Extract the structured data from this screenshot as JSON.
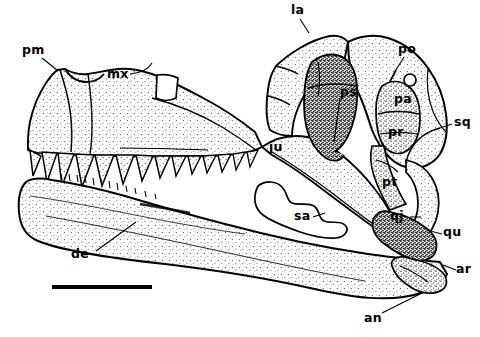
{
  "figure": {
    "view": "left lateral",
    "background_color": "#ffffff",
    "ink_color": "#000000"
  },
  "labels": [
    {
      "id": "pm",
      "text": "pm",
      "name": "premaxilla",
      "x": 22,
      "y": 44,
      "leader": [
        [
          42,
          58
        ],
        [
          57,
          70
        ]
      ]
    },
    {
      "id": "mx",
      "text": "mx",
      "name": "maxilla",
      "x": 107,
      "y": 68,
      "leader": [
        [
          130,
          74
        ],
        [
          143,
          72
        ],
        [
          152,
          63
        ]
      ]
    },
    {
      "id": "la",
      "text": "la",
      "name": "lacrimal",
      "x": 291,
      "y": 4,
      "leader": [
        [
          300,
          19
        ],
        [
          309,
          33
        ]
      ]
    },
    {
      "id": "po",
      "text": "po",
      "name": "postorbital",
      "x": 398,
      "y": 43,
      "leader": [
        [
          404,
          57
        ],
        [
          396,
          70
        ]
      ]
    },
    {
      "id": "ps",
      "text": "ps",
      "name": "parietal-squamosal region",
      "x": 340,
      "y": 86,
      "leader": []
    },
    {
      "id": "pa",
      "text": "pa",
      "name": "parietal",
      "x": 394,
      "y": 93,
      "leader": []
    },
    {
      "id": "pr",
      "text": "pr",
      "name": "prootic",
      "x": 388,
      "y": 126,
      "leader": []
    },
    {
      "id": "sq",
      "text": "sq",
      "name": "squamosal",
      "x": 454,
      "y": 116,
      "leader": [
        [
          452,
          124
        ],
        [
          440,
          128
        ]
      ]
    },
    {
      "id": "ju",
      "text": "ju",
      "name": "jugal",
      "x": 269,
      "y": 141,
      "leader": []
    },
    {
      "id": "pt",
      "text": "pt",
      "name": "pterygoid",
      "x": 382,
      "y": 176,
      "leader": []
    },
    {
      "id": "qj",
      "text": "qj",
      "name": "quadratojugal",
      "x": 390,
      "y": 210,
      "leader": [
        [
          410,
          217
        ],
        [
          421,
          217
        ]
      ]
    },
    {
      "id": "qu",
      "text": "qu",
      "name": "quadrate",
      "x": 443,
      "y": 226,
      "leader": [
        [
          442,
          234
        ],
        [
          430,
          231
        ]
      ]
    },
    {
      "id": "sa",
      "text": "sa",
      "name": "surangular",
      "x": 294,
      "y": 210,
      "leader": [
        [
          313,
          217
        ],
        [
          325,
          213
        ]
      ]
    },
    {
      "id": "ar",
      "text": "ar",
      "name": "articular",
      "x": 456,
      "y": 263,
      "leader": [
        [
          456,
          270
        ],
        [
          443,
          265
        ]
      ]
    },
    {
      "id": "an",
      "text": "an",
      "name": "angular",
      "x": 364,
      "y": 312,
      "leader": [
        [
          382,
          313
        ],
        [
          424,
          292
        ]
      ]
    },
    {
      "id": "de",
      "text": "de",
      "name": "dentary",
      "x": 71,
      "y": 248,
      "leader": [
        [
          96,
          251
        ],
        [
          136,
          222
        ]
      ]
    }
  ],
  "scale_bar": {
    "x1": 52,
    "y1": 287,
    "x2": 152,
    "y2": 288,
    "thickness": 4
  }
}
